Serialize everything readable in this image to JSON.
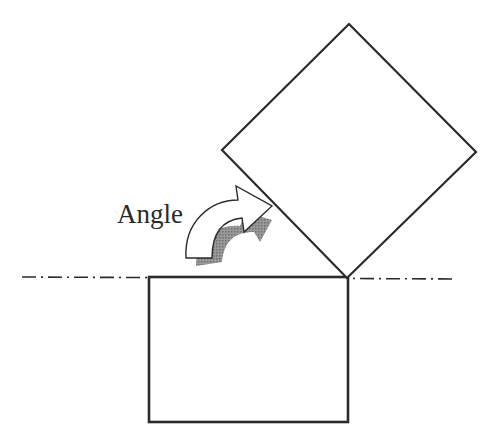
{
  "diagram": {
    "label": "Angle",
    "stroke_color": "#2b2b2b",
    "shadow_color": "#8a8a8a",
    "background": "#ffffff",
    "shapes": {
      "base_rectangle": {
        "x": 149,
        "y": 277,
        "width": 199,
        "height": 145
      },
      "rotated_square": {
        "points": "349,24 476,152 347,278 222,150"
      },
      "centerline": {
        "x1": 22,
        "y1": 277,
        "x2": 456,
        "y2": 279,
        "style": "dash-dot"
      }
    },
    "arrow": {
      "icon": "curved-arrow-icon",
      "direction": "clockwise rotation"
    }
  }
}
